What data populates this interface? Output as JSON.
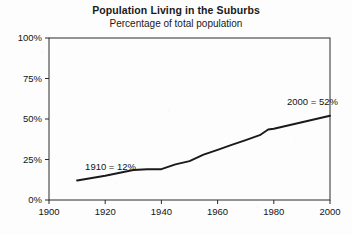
{
  "chart_data": {
    "type": "line",
    "title": "Population Living in the Suburbs",
    "subtitle": "Percentage of total population",
    "xlabel": "",
    "ylabel": "",
    "xlim": [
      1900,
      2000
    ],
    "ylim": [
      0,
      100
    ],
    "grid": false,
    "legend": "none",
    "x_ticks": [
      1900,
      1920,
      1940,
      1960,
      1980,
      2000
    ],
    "x_tick_labels": [
      "1900",
      "1920",
      "1940",
      "1960",
      "1980",
      "2000"
    ],
    "y_ticks": [
      0,
      25,
      50,
      75,
      100
    ],
    "y_tick_labels": [
      "0%",
      "25%",
      "50%",
      "75%",
      "100%"
    ],
    "series": [
      {
        "name": "Percentage living in the suburbs",
        "color": "#1a1a1a",
        "x": [
          1910,
          1920,
          1930,
          1935,
          1940,
          1945,
          1950,
          1955,
          1960,
          1965,
          1970,
          1975,
          1978,
          1980,
          1985,
          1990,
          1995,
          2000
        ],
        "values": [
          12,
          15,
          18.5,
          19,
          19,
          22,
          24,
          28,
          31,
          34,
          37,
          40,
          43.5,
          44,
          46,
          48,
          50,
          52
        ]
      }
    ],
    "annotations": [
      {
        "text": "1910 = 12%",
        "x": 1910,
        "y": 12,
        "position": "above-left"
      },
      {
        "text": "2000 = 52%",
        "x": 2000,
        "y": 52,
        "position": "above-left"
      }
    ]
  }
}
